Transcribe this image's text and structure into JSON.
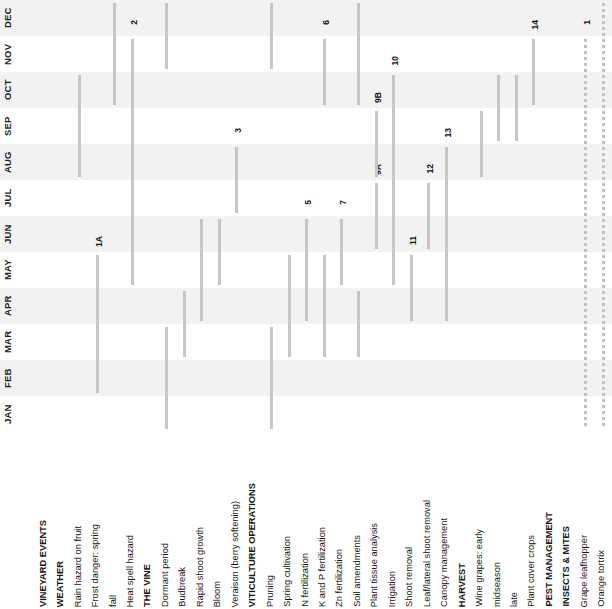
{
  "chart_data": {
    "type": "bar",
    "orientation": "rotated-gantt",
    "xlabel": "",
    "ylabel": "",
    "grid": "alternating-month-bands",
    "legend": "none",
    "months": [
      "JAN",
      "FEB",
      "MAR",
      "APR",
      "MAY",
      "JUN",
      "JUL",
      "AUG",
      "SEP",
      "OCT",
      "NOV",
      "DEC"
    ],
    "categories": [
      "VINEYARD EVENTS",
      "WEATHER",
      "Rain hazard on fruit",
      "Frost danger:  spring",
      "fall",
      "Heat spell hazard",
      "THE VINE",
      "Dormant period",
      "Budbreak",
      "Rapid shoot growth",
      "Bloom",
      "Veraison (berry softening)",
      "VITICULTURE OPERATIONS",
      "Pruning",
      "Spring cultivation",
      "N fertilization",
      "K and P fertilization",
      "Zn fertilization",
      "Soil amendments",
      "Plant tissue analysis",
      "Irrigation",
      "Shoot removal",
      "Leaf/lateral shoot removal",
      "Canopy management",
      "HARVEST",
      "Wine grapes:   early",
      "midseason",
      "late",
      "Plant cover crops",
      "PEST MANAGEMENT",
      "INSECTS & MITES",
      "Grape leafhopper",
      "Orange tortrix"
    ],
    "bars": [
      {
        "row": "Rain hazard on fruit",
        "start_month": "AUG",
        "end_month": "OCT",
        "label": ""
      },
      {
        "row": "Frost danger:  spring",
        "start_month": "FEB",
        "end_month": "MAY",
        "label": "1A"
      },
      {
        "row": "fall",
        "start_month": "OCT",
        "end_month": "DEC",
        "label": "1B"
      },
      {
        "row": "Heat spell hazard",
        "start_month": "MAY",
        "end_month": "NOV",
        "label": "2"
      },
      {
        "row": "Dormant period",
        "start_month": "JAN",
        "end_month": "MAR",
        "label": ""
      },
      {
        "row": "Dormant period (late)",
        "start_month": "NOV",
        "end_month": "DEC",
        "label": ""
      },
      {
        "row": "Budbreak",
        "start_month": "MAR",
        "end_month": "APR",
        "label": ""
      },
      {
        "row": "Rapid shoot growth",
        "start_month": "APR",
        "end_month": "JUN",
        "label": ""
      },
      {
        "row": "Bloom",
        "start_month": "MAY",
        "end_month": "JUN",
        "label": ""
      },
      {
        "row": "Veraison (berry softening)",
        "start_month": "JUL",
        "end_month": "AUG",
        "label": "3"
      },
      {
        "row": "Pruning",
        "start_month": "JAN",
        "end_month": "MAR",
        "label": ""
      },
      {
        "row": "Pruning (late)",
        "start_month": "NOV",
        "end_month": "DEC",
        "label": "4"
      },
      {
        "row": "Spring cultivation",
        "start_month": "MAR",
        "end_month": "MAY",
        "label": ""
      },
      {
        "row": "N fertilization",
        "start_month": "APR",
        "end_month": "JUN",
        "label": "5"
      },
      {
        "row": "K and P fertilization",
        "start_month": "MAR",
        "end_month": "MAY",
        "label": ""
      },
      {
        "row": "K and P fertilization (fall)",
        "start_month": "OCT",
        "end_month": "NOV",
        "label": "6"
      },
      {
        "row": "Zn fertilization",
        "start_month": "MAY",
        "end_month": "JUN",
        "label": "7"
      },
      {
        "row": "Soil amendments",
        "start_month": "MAR",
        "end_month": "APR",
        "label": ""
      },
      {
        "row": "Soil amendments (fall)",
        "start_month": "OCT",
        "end_month": "DEC",
        "label": "8"
      },
      {
        "row": "Plant tissue analysis",
        "start_month": "JUN",
        "end_month": "JUL",
        "label": "9A"
      },
      {
        "row": "Plant tissue analysis (B)",
        "start_month": "AUG",
        "end_month": "SEP",
        "label": "9B"
      },
      {
        "row": "Irrigation",
        "start_month": "MAY",
        "end_month": "OCT",
        "label": "10"
      },
      {
        "row": "Shoot removal",
        "start_month": "APR",
        "end_month": "MAY",
        "label": "11"
      },
      {
        "row": "Leaf/lateral shoot removal",
        "start_month": "JUN",
        "end_month": "JUL",
        "label": "12"
      },
      {
        "row": "Canopy management",
        "start_month": "APR",
        "end_month": "AUG",
        "label": "13"
      },
      {
        "row": "Wine grapes:   early",
        "start_month": "AUG",
        "end_month": "SEP",
        "label": ""
      },
      {
        "row": "midseason",
        "start_month": "SEP",
        "end_month": "OCT",
        "label": ""
      },
      {
        "row": "late",
        "start_month": "SEP",
        "end_month": "OCT",
        "label": ""
      },
      {
        "row": "Plant cover crops",
        "start_month": "OCT",
        "end_month": "NOV",
        "label": "14"
      },
      {
        "row": "Grape leafhopper",
        "start_month": "JAN",
        "end_month": "NOV",
        "label": "1",
        "style": "dotted"
      },
      {
        "row": "Orange tortrix",
        "start_month": "JAN",
        "end_month": "DEC",
        "label": "2",
        "style": "dotted"
      }
    ]
  },
  "months": [
    {
      "label": "DEC"
    },
    {
      "label": "NOV"
    },
    {
      "label": "OCT"
    },
    {
      "label": "SEP"
    },
    {
      "label": "AUG"
    },
    {
      "label": "JUL"
    },
    {
      "label": "JUN"
    },
    {
      "label": "MAY"
    },
    {
      "label": "APR"
    },
    {
      "label": "MAR"
    },
    {
      "label": "FEB"
    },
    {
      "label": "JAN"
    }
  ],
  "rows": [
    {
      "label": "VINEYARD EVENTS",
      "bold": true
    },
    {
      "label": "WEATHER",
      "bold": true
    },
    {
      "label": "Rain hazard on fruit",
      "bold": false
    },
    {
      "label": "Frost danger:   spring",
      "bold": false
    },
    {
      "label": "fall",
      "bold": false
    },
    {
      "label": "Heat spell hazard",
      "bold": false
    },
    {
      "label": "THE VINE",
      "bold": true
    },
    {
      "label": "Dormant period",
      "bold": false
    },
    {
      "label": "Budbreak",
      "bold": false
    },
    {
      "label": "Rapid shoot growth",
      "bold": false
    },
    {
      "label": "Bloom",
      "bold": false
    },
    {
      "label": "Veraison (berry softening)",
      "bold": false
    },
    {
      "label": "VITICULTURE OPERATIONS",
      "bold": true
    },
    {
      "label": "Pruning",
      "bold": false
    },
    {
      "label": "Spring cultivation",
      "bold": false
    },
    {
      "label": "N fertilization",
      "bold": false
    },
    {
      "label": "K and P fertilization",
      "bold": false
    },
    {
      "label": "Zn fertilization",
      "bold": false
    },
    {
      "label": "Soil amendments",
      "bold": false
    },
    {
      "label": "Plant tissue analysis",
      "bold": false
    },
    {
      "label": "Irrigation",
      "bold": false
    },
    {
      "label": "Shoot removal",
      "bold": false
    },
    {
      "label": "Leaf/lateral shoot removal",
      "bold": false
    },
    {
      "label": "Canopy management",
      "bold": false
    },
    {
      "label": "HARVEST",
      "bold": true
    },
    {
      "label": "Wine grapes:    early",
      "bold": false
    },
    {
      "label": "midseason",
      "bold": false
    },
    {
      "label": "late",
      "bold": false
    },
    {
      "label": "Plant cover crops",
      "bold": false
    },
    {
      "label": "PEST MANAGEMENT",
      "bold": true
    },
    {
      "label": "INSECTS & MITES",
      "bold": true
    },
    {
      "label": "Grape leafhopper",
      "bold": false
    },
    {
      "label": "Orange tortrix",
      "bold": false
    }
  ],
  "bar_numbers": [
    "1A",
    "1B",
    "2",
    "3",
    "4",
    "5",
    "6",
    "7",
    "8",
    "9A",
    "9B",
    "10",
    "11",
    "12",
    "13",
    "14",
    "1",
    "2"
  ],
  "colors": {
    "bar": "#c6c6c6",
    "band": "#f2f2f2",
    "background": "#ffffff",
    "text": "#1a1a1a"
  }
}
